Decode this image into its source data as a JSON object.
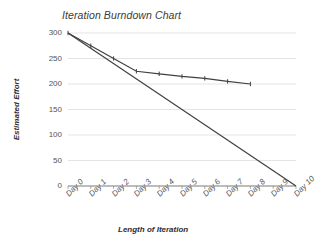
{
  "chart_data": {
    "type": "line",
    "title": "Iteration Burndown Chart",
    "xlabel": "Length of Iteration",
    "ylabel": "Estimated Effort",
    "categories": [
      "Day 0",
      "Day 1",
      "Day 2",
      "Day 3",
      "Day 4",
      "Day 5",
      "Day 6",
      "Day 7",
      "Day 8",
      "Day 9",
      "Day 10"
    ],
    "ylim": [
      0,
      300
    ],
    "yticks": [
      0,
      50,
      100,
      150,
      200,
      250,
      300
    ],
    "ytick_labels": [
      "0",
      "50",
      "100",
      "150",
      "200",
      "250",
      "300"
    ],
    "grid": true,
    "legend": "none",
    "series": [
      {
        "name": "Actual Effort Remaining",
        "color": "#404040",
        "marker": "tick",
        "x": [
          "Day 0",
          "Day 1",
          "Day 2",
          "Day 3",
          "Day 4",
          "Day 5",
          "Day 6",
          "Day 7",
          "Day 8"
        ],
        "values": [
          300,
          275,
          250,
          225,
          220,
          215,
          211,
          205,
          200
        ]
      },
      {
        "name": "Ideal Burndown",
        "color": "#404040",
        "marker": "none",
        "x": [
          "Day 0",
          "Day 10"
        ],
        "values": [
          300,
          0
        ]
      }
    ]
  },
  "axes": {
    "y_title": "Estimated Effort",
    "x_title": "Length of Iteration"
  }
}
